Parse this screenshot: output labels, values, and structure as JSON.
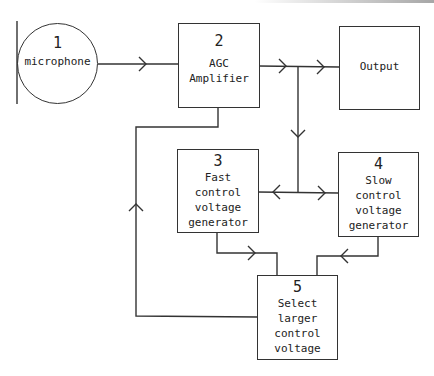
{
  "diagram": {
    "colors": {
      "line": "#333333",
      "text": "#222222",
      "background": "#ffffff"
    },
    "nodes": [
      {
        "id": "1",
        "number": "1",
        "lines": [
          "microphone"
        ],
        "shape": "circle"
      },
      {
        "id": "2",
        "number": "2",
        "lines": [
          "AGC",
          "Amplifier"
        ],
        "shape": "box"
      },
      {
        "id": "out",
        "number": "",
        "lines": [
          "Output"
        ],
        "shape": "box"
      },
      {
        "id": "3",
        "number": "3",
        "lines": [
          "Fast",
          "control",
          "voltage",
          "generator"
        ],
        "shape": "box"
      },
      {
        "id": "4",
        "number": "4",
        "lines": [
          "Slow",
          "control",
          "voltage",
          "generator"
        ],
        "shape": "box"
      },
      {
        "id": "5",
        "number": "5",
        "lines": [
          "Select",
          "larger",
          "control",
          "voltage"
        ],
        "shape": "box"
      }
    ],
    "edges": [
      {
        "from": "1",
        "to": "2"
      },
      {
        "from": "2",
        "to": "out"
      },
      {
        "from": "2",
        "to": "3"
      },
      {
        "from": "2",
        "to": "4"
      },
      {
        "from": "3",
        "to": "5"
      },
      {
        "from": "4",
        "to": "5"
      },
      {
        "from": "5",
        "to": "2",
        "label": "feedback"
      }
    ]
  }
}
